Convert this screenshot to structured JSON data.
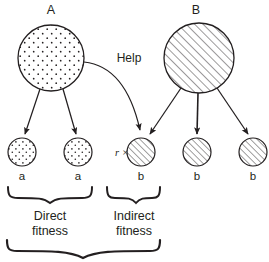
{
  "figure": {
    "type": "kin-selection-inclusive-fitness-diagram",
    "individuals": [
      {
        "id": "A",
        "label": "A",
        "fill_pattern": "stipple-dots",
        "cx": 51,
        "cy": 58,
        "r": 33
      },
      {
        "id": "B",
        "label": "B",
        "fill_pattern": "diagonal-hatch",
        "cx": 199,
        "cy": 58,
        "r": 35
      }
    ],
    "help_arrow": {
      "label": "Help",
      "from": "A",
      "to": "offspring-3"
    },
    "offspring": [
      {
        "id": "offspring-1",
        "label": "a",
        "fill_pattern": "stipple-dots",
        "cx": 22,
        "cy": 152,
        "r": 14,
        "prefix": ""
      },
      {
        "id": "offspring-2",
        "label": "a",
        "fill_pattern": "stipple-dots",
        "cx": 78,
        "cy": 152,
        "r": 14,
        "prefix": ""
      },
      {
        "id": "offspring-3",
        "label": "b",
        "fill_pattern": "diagonal-hatch",
        "cx": 141,
        "cy": 152,
        "r": 14,
        "prefix": "r ×"
      },
      {
        "id": "offspring-4",
        "label": "b",
        "fill_pattern": "diagonal-hatch",
        "cx": 197,
        "cy": 152,
        "r": 14,
        "prefix": ""
      },
      {
        "id": "offspring-5",
        "label": "b",
        "fill_pattern": "diagonal-hatch",
        "cx": 253,
        "cy": 152,
        "r": 14,
        "prefix": ""
      }
    ],
    "braces": [
      {
        "id": "direct",
        "line1": "Direct",
        "line2": "fitness",
        "x_start": 7,
        "x_end": 93,
        "y": 190
      },
      {
        "id": "indirect",
        "line1": "Indirect",
        "line2": "fitness",
        "x_start": 106,
        "x_end": 160,
        "y": 190
      },
      {
        "id": "total",
        "line1": "",
        "line2": "",
        "x_start": 6,
        "x_end": 160,
        "y": 236
      }
    ],
    "colors": {
      "ink": "#231f20",
      "background": "#ffffff"
    }
  }
}
